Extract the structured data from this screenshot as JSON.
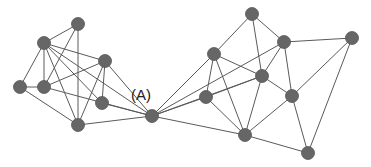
{
  "diagram": {
    "type": "network-graph",
    "label": "(A)",
    "label_position": [
      131,
      100
    ],
    "colors": {
      "node": "#666666",
      "edge": "#5a5a5a",
      "label": "#222222",
      "background": "#ffffff"
    },
    "node_radius": 6.5,
    "nodes": [
      {
        "id": "L1",
        "x": 78,
        "y": 24
      },
      {
        "id": "L2",
        "x": 44,
        "y": 43
      },
      {
        "id": "L3",
        "x": 105,
        "y": 61
      },
      {
        "id": "L4",
        "x": 20,
        "y": 87
      },
      {
        "id": "L5",
        "x": 44,
        "y": 87
      },
      {
        "id": "L6",
        "x": 102,
        "y": 103
      },
      {
        "id": "L7",
        "x": 78,
        "y": 125
      },
      {
        "id": "A",
        "x": 152,
        "y": 116
      },
      {
        "id": "R1",
        "x": 252,
        "y": 14
      },
      {
        "id": "R2",
        "x": 284,
        "y": 42
      },
      {
        "id": "R3",
        "x": 352,
        "y": 38
      },
      {
        "id": "R4",
        "x": 214,
        "y": 54
      },
      {
        "id": "R5",
        "x": 262,
        "y": 76
      },
      {
        "id": "R6",
        "x": 206,
        "y": 97
      },
      {
        "id": "R7",
        "x": 292,
        "y": 96
      },
      {
        "id": "R8",
        "x": 245,
        "y": 135
      },
      {
        "id": "R9",
        "x": 308,
        "y": 153
      }
    ],
    "edges": [
      [
        "L1",
        "L2"
      ],
      [
        "L1",
        "L5"
      ],
      [
        "L1",
        "L7"
      ],
      [
        "L2",
        "L4"
      ],
      [
        "L2",
        "L5"
      ],
      [
        "L2",
        "L7"
      ],
      [
        "L2",
        "L3"
      ],
      [
        "L2",
        "L6"
      ],
      [
        "L2",
        "A"
      ],
      [
        "L3",
        "L5"
      ],
      [
        "L3",
        "L6"
      ],
      [
        "L3",
        "L7"
      ],
      [
        "L3",
        "A"
      ],
      [
        "L4",
        "L5"
      ],
      [
        "L4",
        "L7"
      ],
      [
        "L5",
        "A"
      ],
      [
        "L6",
        "A"
      ],
      [
        "L7",
        "A"
      ],
      [
        "A",
        "R4"
      ],
      [
        "A",
        "R6"
      ],
      [
        "A",
        "R5"
      ],
      [
        "A",
        "R2"
      ],
      [
        "A",
        "R8"
      ],
      [
        "R1",
        "R4"
      ],
      [
        "R1",
        "R2"
      ],
      [
        "R1",
        "R5"
      ],
      [
        "R2",
        "R3"
      ],
      [
        "R2",
        "R5"
      ],
      [
        "R2",
        "R7"
      ],
      [
        "R3",
        "R7"
      ],
      [
        "R3",
        "R9"
      ],
      [
        "R4",
        "R6"
      ],
      [
        "R4",
        "R5"
      ],
      [
        "R4",
        "R8"
      ],
      [
        "R5",
        "R6"
      ],
      [
        "R5",
        "R7"
      ],
      [
        "R5",
        "R8"
      ],
      [
        "R6",
        "R8"
      ],
      [
        "R7",
        "R8"
      ],
      [
        "R7",
        "R9"
      ],
      [
        "R8",
        "R9"
      ]
    ]
  }
}
